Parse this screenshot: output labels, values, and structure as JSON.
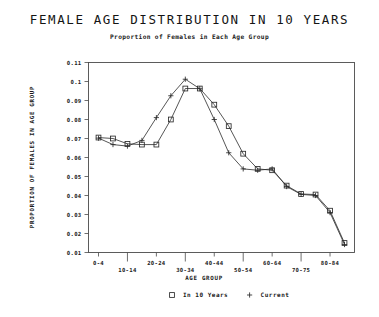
{
  "chart_data": {
    "type": "line",
    "title": "FEMALE AGE DISTRIBUTION IN 10 YEARS",
    "subtitle": "Proportion of Females in Each Age Group",
    "xlabel": "AGE GROUP",
    "ylabel": "PROPORTION OF FEMALES IN AGE GROUP",
    "categories": [
      "0-4",
      "5-9",
      "10-14",
      "15-19",
      "20-24",
      "25-29",
      "30-34",
      "35-39",
      "40-44",
      "45-49",
      "50-54",
      "55-59",
      "60-64",
      "65-69",
      "70-75",
      "75-79",
      "80-84",
      "85-89"
    ],
    "xtick_labels_upper": [
      "0-4",
      "20-24",
      "40-44",
      "60-64",
      "80-84"
    ],
    "xtick_labels_lower": [
      "10-14",
      "30-34",
      "50-54",
      "70-75"
    ],
    "ytick_labels": [
      "0.11",
      "0.1",
      "0.09",
      "0.08",
      "0.07",
      "0.06",
      "0.05",
      "0.04",
      "0.03",
      "0.02",
      "0.01"
    ],
    "ylim": [
      0.01,
      0.11
    ],
    "grid": false,
    "legend_position": "bottom",
    "series": [
      {
        "name": "In 10 Years",
        "marker": "square",
        "values": [
          0.0705,
          0.07,
          0.0672,
          0.0668,
          0.0668,
          0.08,
          0.0963,
          0.0963,
          0.0878,
          0.0765,
          0.062,
          0.054,
          0.0533,
          0.0452,
          0.0408,
          0.0405,
          0.032,
          0.015
        ]
      },
      {
        "name": "Current",
        "marker": "plus",
        "values": [
          0.0702,
          0.0668,
          0.066,
          0.069,
          0.081,
          0.0925,
          0.1012,
          0.0962,
          0.08,
          0.0625,
          0.054,
          0.0533,
          0.054,
          0.0447,
          0.0406,
          0.04,
          0.031,
          0.0142
        ]
      }
    ]
  },
  "legend": {
    "items": [
      {
        "label": "In 10 Years",
        "marker": "square"
      },
      {
        "label": "Current",
        "marker": "plus"
      }
    ]
  },
  "colors": {
    "background": "#ffffff",
    "ink": "#1a1a1a",
    "line": "#2b2b2b",
    "frame": "#4a4a4a"
  }
}
